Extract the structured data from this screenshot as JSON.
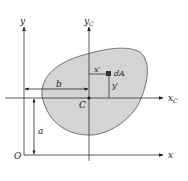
{
  "diagram": {
    "colors": {
      "region_fill": "#d4d4d4",
      "region_stroke": "#555555",
      "axis": "#333333",
      "element": "#333333"
    },
    "labels": {
      "y_axis": "y",
      "yc_axis": "y",
      "yc_sub": "C",
      "x_axis": "x",
      "xc_axis": "x",
      "xc_sub": "C",
      "origin": "O",
      "centroid": "C",
      "element": "dA",
      "x_prime": "x′",
      "y_prime": "y′",
      "dist_b": "b",
      "dist_a": "a"
    }
  }
}
